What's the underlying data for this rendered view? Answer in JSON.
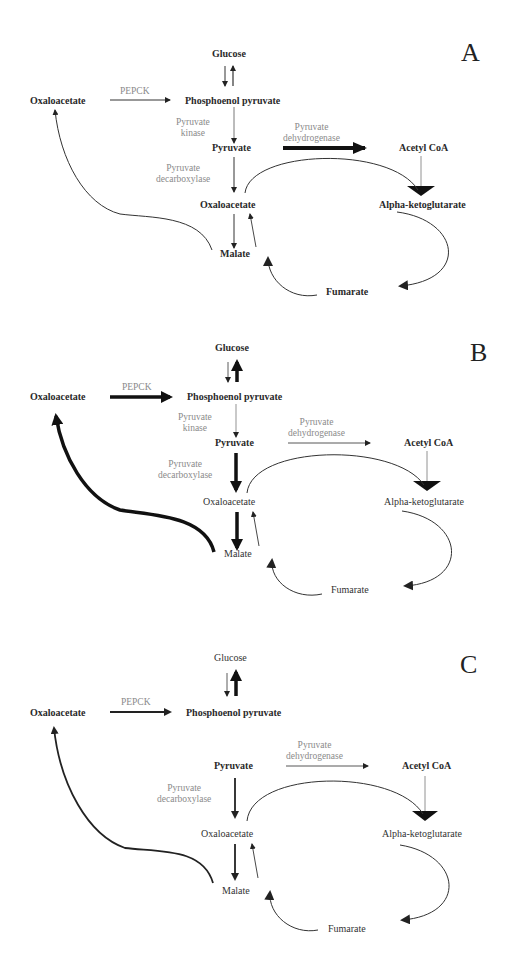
{
  "figure": {
    "panels": [
      {
        "id": "A",
        "letter": "A",
        "metabolites": {
          "glucose": "Glucose",
          "oaa_left": "Oxaloacetate",
          "pep": "Phosphoenol pyruvate",
          "pyruvate": "Pyruvate",
          "acetyl_coa": "Acetyl CoA",
          "oaa": "Oxaloacetate",
          "akg": "Alpha-ketoglutarate",
          "malate": "Malate",
          "fumarate": "Fumarate"
        },
        "enzymes": {
          "pepck": "PEPCK",
          "pk_line1": "Pyruvate",
          "pk_line2": "kinase",
          "pdh_line1": "Pyruvate",
          "pdh_line2": "dehydrogenase",
          "pdc_line1": "Pyruvate",
          "pdc_line2": "decarboxylase"
        },
        "flux": {
          "pepck": "thin",
          "glucose_up": "thin",
          "pk": "thin",
          "pdh": "thick",
          "pdc": "thin",
          "oaa_to_malate": "thin",
          "malate_to_oaa_left": "thin"
        }
      },
      {
        "id": "B",
        "letter": "B",
        "metabolites": {
          "glucose": "Glucose",
          "oaa_left": "Oxaloacetate",
          "pep": "Phosphoenol pyruvate",
          "pyruvate": "Pyruvate",
          "acetyl_coa": "Acetyl CoA",
          "oaa": "Oxaloacetate",
          "akg": "Alpha-ketoglutarate",
          "malate": "Malate",
          "fumarate": "Fumarate"
        },
        "enzymes": {
          "pepck": "PEPCK",
          "pk_line1": "Pyruvate",
          "pk_line2": "kinase",
          "pdh_line1": "Pyruvate",
          "pdh_line2": "dehydrogenase",
          "pdc_line1": "Pyruvate",
          "pdc_line2": "decarboxylase"
        },
        "flux": {
          "pepck": "thick",
          "glucose_up": "thick",
          "pk": "thin",
          "pdh": "thin",
          "pdc": "thick",
          "oaa_to_malate": "thick",
          "malate_to_oaa_left": "thick"
        }
      },
      {
        "id": "C",
        "letter": "C",
        "metabolites": {
          "glucose": "Glucose",
          "oaa_left": "Oxaloacetate",
          "pep": "Phosphoenol pyruvate",
          "pyruvate": "Pyruvate",
          "acetyl_coa": "Acetyl CoA",
          "oaa": "Oxaloacetate",
          "akg": "Alpha-ketoglutarate",
          "malate": "Malate",
          "fumarate": "Fumarate"
        },
        "enzymes": {
          "pepck": "PEPCK",
          "pdh_line1": "Pyruvate",
          "pdh_line2": "dehydrogenase",
          "pdc_line1": "Pyruvate",
          "pdc_line2": "decarboxylase"
        },
        "flux": {
          "pepck": "medium",
          "glucose_up": "thick",
          "pk": "absent",
          "pdh": "thin",
          "pdc": "medium",
          "oaa_to_malate": "medium",
          "malate_to_oaa_left": "medium"
        }
      }
    ]
  }
}
